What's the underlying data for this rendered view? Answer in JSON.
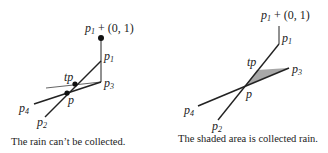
{
  "left_panel": {
    "labels": {
      "p1_plus": "p",
      "p1_plus_sub": "1",
      "p1_plus_rest": " + (0, 1)",
      "p1": "p",
      "p1_sub": "1",
      "p3": "p",
      "p3_sub": "3",
      "tp": "tp",
      "p": "p",
      "p4": "p",
      "p4_sub": "4",
      "p2": "p",
      "p2_sub": "2"
    },
    "caption": "The rain can’t be collected."
  },
  "right_panel": {
    "labels": {
      "p1_plus": "p",
      "p1_plus_sub": "1",
      "p1_plus_rest": " + (0, 1)",
      "p1": "p",
      "p1_sub": "1",
      "p3": "p",
      "p3_sub": "3",
      "tp": "tp",
      "p": "p",
      "p4": "p",
      "p4_sub": "4",
      "p2": "p",
      "p2_sub": "2"
    },
    "caption": "The shaded area is collected rain.",
    "shade_color": "#a8a8a8"
  }
}
